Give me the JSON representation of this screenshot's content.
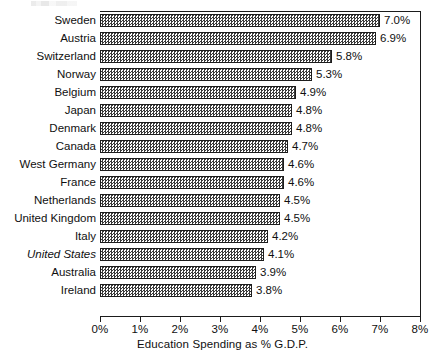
{
  "chart_data": {
    "type": "bar",
    "orientation": "horizontal",
    "title": "",
    "xlabel": "Education Spending as % G.D.P.",
    "ylabel": "",
    "xlim": [
      0,
      8
    ],
    "grid": false,
    "legend": null,
    "value_suffix": "%",
    "categories": [
      "Sweden",
      "Austria",
      "Switzerland",
      "Norway",
      "Belgium",
      "Japan",
      "Denmark",
      "Canada",
      "West Germany",
      "France",
      "Netherlands",
      "United Kingdom",
      "Italy",
      "United States",
      "Australia",
      "Ireland"
    ],
    "values": [
      7.0,
      6.9,
      5.8,
      5.3,
      4.9,
      4.8,
      4.8,
      4.7,
      4.6,
      4.6,
      4.5,
      4.5,
      4.2,
      4.1,
      3.9,
      3.8
    ],
    "data_labels": [
      "7.0%",
      "6.9%",
      "5.8%",
      "5.3%",
      "4.9%",
      "4.8%",
      "4.8%",
      "4.7%",
      "4.6%",
      "4.6%",
      "4.5%",
      "4.5%",
      "4.2%",
      "4.1%",
      "3.9%",
      "3.8%"
    ],
    "emphasized_categories": [
      "United States"
    ],
    "xticks": [
      0,
      1,
      2,
      3,
      4,
      5,
      6,
      7,
      8
    ],
    "xtick_labels": [
      "0%",
      "1%",
      "2%",
      "3%",
      "4%",
      "5%",
      "6%",
      "7%",
      "8%"
    ]
  },
  "style": {
    "bar_fill": "#c8c8c8",
    "bar_outline": "#1d1d1d",
    "axis_color": "#1b1b1b",
    "text_color": "#101010",
    "background": "#ffffff"
  }
}
